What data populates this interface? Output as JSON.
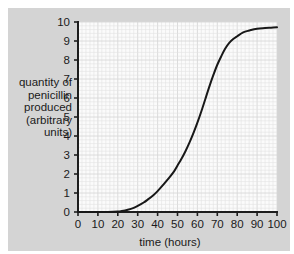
{
  "figure": {
    "panel_bg": "#d4d4d4",
    "plot_bg": "#fbfbfb",
    "curve_color": "#181818",
    "axis_color": "#1d1d1d",
    "grid_minor_color": "#e2e2e2",
    "grid_major_color": "#d8d8d8"
  },
  "chart_data": {
    "type": "line",
    "title": "",
    "xlabel": "time (hours)",
    "ylabel": "quantity of penicillin produced (arbitrary units)",
    "ylabel_lines": [
      "quantity of",
      "penicillin",
      "produced",
      "(arbitrary",
      "units)"
    ],
    "xlim": [
      0,
      100
    ],
    "ylim": [
      0,
      10
    ],
    "xticks": [
      0,
      10,
      20,
      30,
      40,
      50,
      60,
      70,
      80,
      90,
      100
    ],
    "yticks": [
      0,
      1,
      2,
      3,
      4,
      5,
      6,
      7,
      8,
      9,
      10
    ],
    "xtick_labels": [
      "0",
      "10",
      "20",
      "30",
      "40",
      "50",
      "60",
      "70",
      "80",
      "90",
      "100"
    ],
    "ytick_labels": [
      "0",
      "1",
      "2",
      "3",
      "4",
      "5",
      "6",
      "7",
      "8",
      "9",
      "10"
    ],
    "x_minor_step": 2,
    "y_minor_step": 0.2,
    "grid": true,
    "legend": false,
    "series": [
      {
        "name": "penicillin produced",
        "x": [
          0,
          5,
          10,
          15,
          20,
          22,
          25,
          28,
          30,
          33,
          35,
          38,
          40,
          43,
          45,
          48,
          50,
          52,
          54,
          56,
          58,
          60,
          62,
          64,
          66,
          68,
          70,
          72,
          74,
          76,
          78,
          80,
          83,
          86,
          90,
          94,
          97,
          100
        ],
        "values": [
          0,
          0,
          0,
          0,
          0.02,
          0.05,
          0.12,
          0.22,
          0.32,
          0.5,
          0.65,
          0.9,
          1.1,
          1.45,
          1.7,
          2.1,
          2.45,
          2.8,
          3.2,
          3.65,
          4.15,
          4.7,
          5.3,
          5.95,
          6.6,
          7.2,
          7.75,
          8.2,
          8.6,
          8.9,
          9.1,
          9.25,
          9.45,
          9.55,
          9.65,
          9.68,
          9.7,
          9.72
        ]
      }
    ]
  }
}
